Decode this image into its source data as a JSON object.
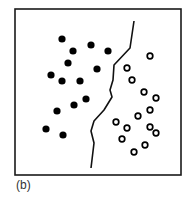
{
  "figure": {
    "caption": "(b)",
    "frame": {
      "x": 15,
      "y": 9,
      "width": 166,
      "height": 166,
      "stroke": "#1a1a1a"
    },
    "boundary": {
      "label": "decision-boundary",
      "points": [
        [
          134,
          21
        ],
        [
          130,
          48
        ],
        [
          114,
          65
        ],
        [
          113,
          80
        ],
        [
          110,
          90
        ],
        [
          112,
          97
        ],
        [
          104,
          110
        ],
        [
          94,
          121
        ],
        [
          91,
          131
        ],
        [
          94,
          143
        ],
        [
          91,
          168
        ]
      ],
      "stroke": "#111111"
    },
    "class_a": {
      "label": "filled-dots",
      "fill": "#000000",
      "radius": 3.6,
      "points": [
        [
          62,
          39
        ],
        [
          91,
          45
        ],
        [
          73,
          51
        ],
        [
          108,
          51
        ],
        [
          68,
          63
        ],
        [
          97,
          69
        ],
        [
          51,
          75
        ],
        [
          62,
          81
        ],
        [
          80,
          81
        ],
        [
          86,
          99
        ],
        [
          74,
          105
        ],
        [
          57,
          111
        ],
        [
          46,
          129
        ],
        [
          63,
          135
        ]
      ]
    },
    "class_b": {
      "label": "hollow-circles",
      "stroke": "#000000",
      "radius": 2.8,
      "points": [
        [
          150,
          56
        ],
        [
          127,
          68
        ],
        [
          132,
          80
        ],
        [
          144,
          92
        ],
        [
          156,
          98
        ],
        [
          150,
          110
        ],
        [
          138,
          116
        ],
        [
          116,
          122
        ],
        [
          127,
          128
        ],
        [
          150,
          127
        ],
        [
          156,
          133
        ],
        [
          122,
          139
        ],
        [
          145,
          145
        ],
        [
          134,
          152
        ]
      ]
    }
  }
}
